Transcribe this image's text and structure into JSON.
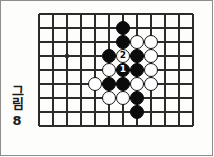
{
  "figure": {
    "caption_word": "그림",
    "caption_number": "8",
    "type": "go-board-diagram"
  },
  "board": {
    "columns": 12,
    "rows": 9,
    "cell_size": 14,
    "line_color": "#2b2b2b",
    "board_color": "#fdfdfb",
    "origin_x": 38,
    "origin_y": 13,
    "star_points": [
      {
        "col": 2,
        "row": 3
      }
    ]
  },
  "stones": [
    {
      "col": 6,
      "row": 1,
      "color": "black",
      "label": ""
    },
    {
      "col": 6,
      "row": 2,
      "color": "black",
      "label": ""
    },
    {
      "col": 7,
      "row": 2,
      "color": "white",
      "label": ""
    },
    {
      "col": 8,
      "row": 2,
      "color": "white",
      "label": ""
    },
    {
      "col": 5,
      "row": 3,
      "color": "black",
      "label": ""
    },
    {
      "col": 6,
      "row": 3,
      "color": "white",
      "label": "2"
    },
    {
      "col": 7,
      "row": 3,
      "color": "black",
      "label": ""
    },
    {
      "col": 8,
      "row": 3,
      "color": "white",
      "label": ""
    },
    {
      "col": 5,
      "row": 4,
      "color": "white",
      "label": ""
    },
    {
      "col": 6,
      "row": 4,
      "color": "black",
      "label": "1"
    },
    {
      "col": 7,
      "row": 4,
      "color": "black",
      "label": ""
    },
    {
      "col": 8,
      "row": 4,
      "color": "white",
      "label": ""
    },
    {
      "col": 4,
      "row": 5,
      "color": "white",
      "label": ""
    },
    {
      "col": 5,
      "row": 5,
      "color": "black",
      "label": ""
    },
    {
      "col": 6,
      "row": 5,
      "color": "black",
      "label": ""
    },
    {
      "col": 7,
      "row": 5,
      "color": "white",
      "label": ""
    },
    {
      "col": 8,
      "row": 5,
      "color": "white",
      "label": ""
    },
    {
      "col": 5,
      "row": 6,
      "color": "white",
      "label": ""
    },
    {
      "col": 6,
      "row": 6,
      "color": "white",
      "label": ""
    },
    {
      "col": 7,
      "row": 6,
      "color": "black",
      "label": ""
    },
    {
      "col": 7,
      "row": 7,
      "color": "black",
      "label": ""
    }
  ],
  "move_labels": {
    "move_1": "1",
    "move_2": "2"
  },
  "colors": {
    "black_stone": "#0b0b0b",
    "white_stone": "#ffffff",
    "grid_line": "#2b2b2b",
    "page_border": "#8d8d8d",
    "text": "#1b1b1b"
  }
}
